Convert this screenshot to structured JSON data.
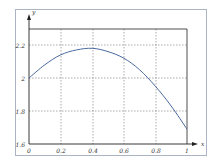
{
  "chart_data": {
    "type": "line",
    "title": "",
    "xlabel": "x",
    "ylabel": "y",
    "xlim": [
      0,
      1
    ],
    "ylim": [
      1.6,
      2.3
    ],
    "grid": true,
    "grid_style": "dashed",
    "x_ticks": [
      "0",
      "0.2",
      "0.4",
      "0.6",
      "0.8",
      "1"
    ],
    "y_ticks": [
      "1.6",
      "1.8",
      "2",
      "2.2"
    ],
    "series": [
      {
        "name": "curve",
        "color": "#4a6a9e",
        "x": [
          0,
          0.1,
          0.2,
          0.3,
          0.4,
          0.5,
          0.6,
          0.7,
          0.8,
          0.9,
          1.0
        ],
        "y": [
          2.0,
          2.08,
          2.14,
          2.17,
          2.18,
          2.16,
          2.12,
          2.05,
          1.95,
          1.83,
          1.69
        ]
      }
    ]
  },
  "axis": {
    "x_label": "x",
    "y_label": "y",
    "x_tick_labels": [
      "0",
      "0.2",
      "0.4",
      "0.6",
      "0.8",
      "1"
    ],
    "y_tick_labels": [
      "1.6",
      "1.8",
      "2",
      "2.2"
    ]
  }
}
